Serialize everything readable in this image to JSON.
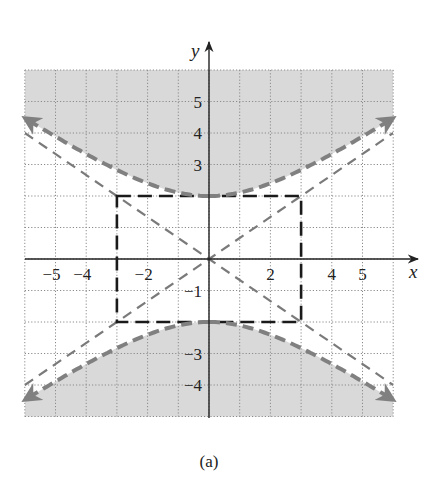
{
  "chart_data": {
    "type": "line",
    "title": "",
    "caption": "(a)",
    "xlabel": "x",
    "ylabel": "y",
    "xlim": [
      -6,
      6
    ],
    "ylim": [
      -5,
      6
    ],
    "grid": true,
    "grid_style": "dotted",
    "x_tick_labels": [
      "-5",
      "-4",
      "-2",
      "2",
      "4",
      "5"
    ],
    "x_ticks": [
      -5,
      -4,
      -2,
      2,
      4,
      5
    ],
    "y_tick_labels": [
      "5",
      "4",
      "3",
      "-1",
      "-3",
      "-4"
    ],
    "y_ticks": [
      5,
      4,
      3,
      -1,
      -3,
      -4
    ],
    "equation": "y^2/4 - x^2/9 = 1",
    "hyperbola": {
      "a": 3,
      "b": 2,
      "vertices": [
        [
          0,
          2
        ],
        [
          0,
          -2
        ]
      ],
      "orientation": "vertical",
      "style": "dashed",
      "color": "#808080"
    },
    "fundamental_rectangle": {
      "corners": [
        [
          -3,
          2
        ],
        [
          3,
          2
        ],
        [
          3,
          -2
        ],
        [
          -3,
          -2
        ]
      ],
      "style": "dashed",
      "color": "#1a1a1a"
    },
    "asymptotes": [
      {
        "equation": "y = (2/3)x",
        "slope": 0.6667,
        "style": "dashed",
        "color": "#7a7a7a"
      },
      {
        "equation": "y = -(2/3)x",
        "slope": -0.6667,
        "style": "dashed",
        "color": "#7a7a7a"
      }
    ],
    "shaded_regions": [
      {
        "description": "above upper branch",
        "inequality": "y^2/4 - x^2/9 > 1, y > 0",
        "color": "#d9d9d9"
      },
      {
        "description": "below lower branch",
        "inequality": "y^2/4 - x^2/9 > 1, y < 0",
        "color": "#d9d9d9"
      }
    ],
    "series": [
      {
        "name": "upper branch",
        "x": [
          -6,
          -5,
          -4,
          -3,
          -2,
          -1,
          0,
          1,
          2,
          3,
          4,
          5,
          6
        ],
        "y": [
          4.47,
          3.89,
          3.33,
          2.83,
          2.4,
          2.11,
          2.0,
          2.11,
          2.4,
          2.83,
          3.33,
          3.89,
          4.47
        ]
      },
      {
        "name": "lower branch",
        "x": [
          -6,
          -5,
          -4,
          -3,
          -2,
          -1,
          0,
          1,
          2,
          3,
          4,
          5,
          6
        ],
        "y": [
          -4.47,
          -3.89,
          -3.33,
          -2.83,
          -2.4,
          -2.11,
          -2.0,
          -2.11,
          -2.4,
          -2.83,
          -3.33,
          -3.89,
          -4.47
        ]
      }
    ],
    "colors": {
      "fill": "#d9d9d9",
      "hyperbola": "#808080",
      "rectangle": "#1a1a1a",
      "asymptote": "#7a7a7a",
      "grid": "#8a8a8a",
      "axis": "#222222"
    }
  }
}
